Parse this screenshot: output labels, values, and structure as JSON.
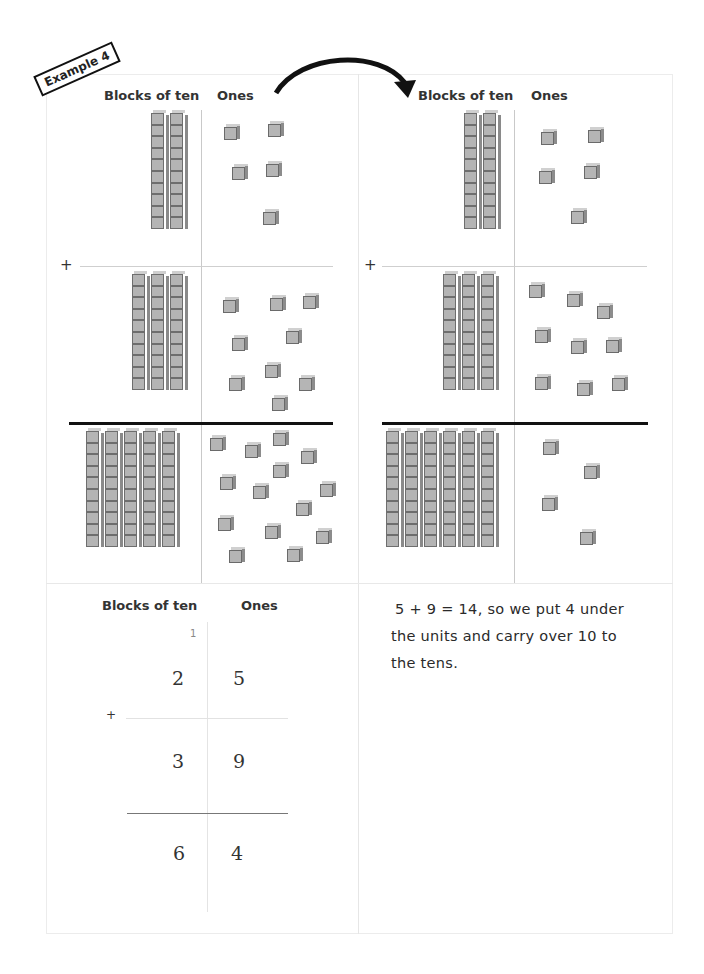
{
  "badge": {
    "label": "Example 4"
  },
  "headers": {
    "tens": "Blocks of ten",
    "ones": "Ones"
  },
  "left_panel": {
    "row1": {
      "tens_rods": 2,
      "ones_cubes": 5
    },
    "row2": {
      "tens_rods": 3,
      "ones_cubes": 9
    },
    "result": {
      "tens_rods": 5,
      "ones_cubes": 14
    }
  },
  "right_panel": {
    "row1": {
      "tens_rods": 2,
      "ones_cubes": 5
    },
    "row2": {
      "tens_rods": 3,
      "ones_cubes": 9
    },
    "result": {
      "tens_rods": 6,
      "ones_cubes": 4
    }
  },
  "arrow": {
    "icon": "curved-arrow-right-icon"
  },
  "operator": "+",
  "written": {
    "carry": "1",
    "row1": {
      "tens": "2",
      "ones": "5"
    },
    "row2": {
      "tens": "3",
      "ones": "9"
    },
    "result": {
      "tens": "6",
      "ones": "4"
    }
  },
  "explanation": {
    "line1": "5 + 9 = 14, so we put 4 under",
    "line2": "the units and carry over 10 to",
    "line3": "the tens."
  }
}
